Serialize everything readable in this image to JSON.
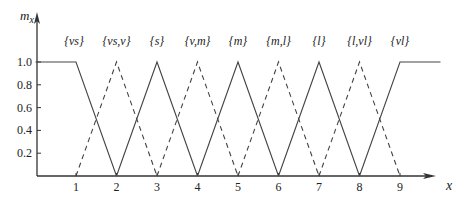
{
  "chart_data": {
    "type": "line",
    "title": "",
    "xlabel": "x",
    "ylabel": "m_x",
    "xlim": [
      0,
      10.3
    ],
    "ylim": [
      0,
      1.0
    ],
    "x_ticks": [
      1,
      2,
      3,
      4,
      5,
      6,
      7,
      8,
      9
    ],
    "x_tick_labels": [
      "1",
      "2",
      "3",
      "4",
      "5",
      "6",
      "7",
      "8",
      "9"
    ],
    "y_ticks": [
      0.2,
      0.4,
      0.6,
      0.8,
      1.0
    ],
    "y_tick_labels": [
      "0.2",
      "0.4",
      "0.6",
      "0.8",
      "1.0"
    ],
    "grid": false,
    "legend": "labels above peaks",
    "series": [
      {
        "name": "{vs}",
        "style": "solid",
        "x": [
          0,
          1,
          2
        ],
        "y": [
          1,
          1,
          0
        ]
      },
      {
        "name": "{vs,v}",
        "style": "dashed",
        "x": [
          1,
          2,
          3
        ],
        "y": [
          0,
          1,
          0
        ]
      },
      {
        "name": "{s}",
        "style": "solid",
        "x": [
          2,
          3,
          4
        ],
        "y": [
          0,
          1,
          0
        ]
      },
      {
        "name": "{v,m}",
        "style": "dashed",
        "x": [
          3,
          4,
          5
        ],
        "y": [
          0,
          1,
          0
        ]
      },
      {
        "name": "{m}",
        "style": "solid",
        "x": [
          4,
          5,
          6
        ],
        "y": [
          0,
          1,
          0
        ]
      },
      {
        "name": "{m,l}",
        "style": "dashed",
        "x": [
          5,
          6,
          7
        ],
        "y": [
          0,
          1,
          0
        ]
      },
      {
        "name": "{l}",
        "style": "solid",
        "x": [
          6,
          7,
          8
        ],
        "y": [
          0,
          1,
          0
        ]
      },
      {
        "name": "{l,vl}",
        "style": "dashed",
        "x": [
          7,
          8,
          9
        ],
        "y": [
          0,
          1,
          0
        ]
      },
      {
        "name": "{vl}",
        "style": "solid",
        "x": [
          8,
          9,
          10
        ],
        "y": [
          0,
          1,
          1
        ]
      }
    ],
    "annotations": [
      {
        "text": "{vs}",
        "x": 0.95
      },
      {
        "text": "{vs,v}",
        "x": 2.0
      },
      {
        "text": "{s}",
        "x": 3.0
      },
      {
        "text": "{v,m}",
        "x": 4.0
      },
      {
        "text": "{m}",
        "x": 5.0
      },
      {
        "text": "{m,l}",
        "x": 6.0
      },
      {
        "text": "{l}",
        "x": 7.0
      },
      {
        "text": "{l,vl}",
        "x": 8.0
      },
      {
        "text": "{vl}",
        "x": 9.0
      }
    ]
  },
  "colors": {
    "line": "#444444",
    "axis": "#333333",
    "text": "#222222"
  }
}
